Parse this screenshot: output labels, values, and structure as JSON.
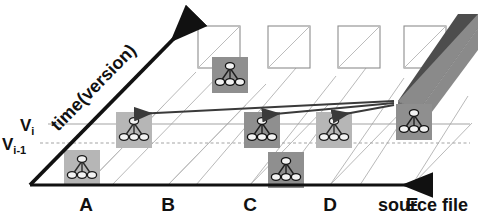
{
  "figure": {
    "type": "diagram",
    "subtype": "3d-skewed-grid-version-history",
    "width": 478,
    "height": 219,
    "background": "#ffffff"
  },
  "axes": {
    "x": {
      "label": "source file",
      "ticks": [
        "A",
        "B",
        "C",
        "D",
        "E"
      ],
      "tick_x": [
        86,
        168,
        250,
        330,
        412
      ],
      "label_x": 455,
      "label_y": 207,
      "baseline_y": 185,
      "start_x": 30,
      "end_x": 432,
      "arrow": "right"
    },
    "y": {
      "label": "time(version)",
      "label_rotation": -46,
      "arrow": "up-right",
      "origin_x": 30,
      "origin_y": 185,
      "tip_x": 196,
      "tip_y": 16
    }
  },
  "version_lines": [
    {
      "name": "Vi",
      "base": "V",
      "sub": "i",
      "y": 124,
      "style": "solid-thin",
      "color": "#9a9a9a",
      "label_x": 20,
      "label_y": 130
    },
    {
      "name": "Vi-1",
      "base": "V",
      "sub": "i-1",
      "y": 143,
      "style": "dashed-thin",
      "color": "#9a9a9a",
      "label_x": 8,
      "label_y": 149
    }
  ],
  "grid": {
    "columns": 5,
    "skew_dx": 78,
    "skew_dy": -80,
    "column_base_x": [
      86,
      168,
      250,
      330,
      412
    ],
    "line_color": "#b8b8b8",
    "top_cells": {
      "count": 4,
      "label": "empty-cell",
      "stroke": "#888888",
      "size": 42,
      "positions": [
        {
          "x": 198,
          "y": 26
        },
        {
          "x": 268,
          "y": 26
        },
        {
          "x": 338,
          "y": 26
        },
        {
          "x": 404,
          "y": 26
        }
      ]
    }
  },
  "nodes": {
    "label": "graph-icon",
    "description": "small call-graph thumbnail: one root node with two children and a leaf",
    "icon_size": 36,
    "fill_light": "#b6b6b6",
    "fill_dark": "#8f8f8f",
    "items": [
      {
        "id": "n1",
        "file": "A",
        "version": "old",
        "x": 64,
        "y": 150,
        "shade": "light"
      },
      {
        "id": "n2",
        "file": "B",
        "version": "Vi",
        "x": 116,
        "y": 112,
        "shade": "light"
      },
      {
        "id": "n3",
        "file": "C",
        "version": "new",
        "x": 212,
        "y": 57,
        "shade": "dark"
      },
      {
        "id": "n4",
        "file": "D",
        "version": "Vi",
        "x": 244,
        "y": 112,
        "shade": "dark"
      },
      {
        "id": "n5",
        "file": "D",
        "version": "old",
        "x": 268,
        "y": 152,
        "shade": "dark"
      },
      {
        "id": "n6",
        "file": "E",
        "version": "Vi",
        "x": 316,
        "y": 112,
        "shade": "light"
      },
      {
        "id": "n7",
        "file": "F",
        "version": "Vi",
        "x": 396,
        "y": 104,
        "shade": "dark"
      }
    ]
  },
  "arrows": {
    "label": "dependency-arrow",
    "color": "#3a3a3a",
    "origin": {
      "x": 394,
      "y": 102
    },
    "targets": [
      {
        "to": "n2",
        "x": 134,
        "y": 112
      },
      {
        "to": "n4",
        "x": 262,
        "y": 112
      },
      {
        "to": "n6",
        "x": 332,
        "y": 112
      }
    ]
  },
  "block": {
    "label": "solid-slab",
    "top_face_color": "#4d4d4d",
    "front_face_color": "#8a8a8a",
    "top_face_points": "400,102 460,16 478,16 478,30 420,108",
    "front_face_points": "400,102 420,108 478,48 478,30"
  }
}
